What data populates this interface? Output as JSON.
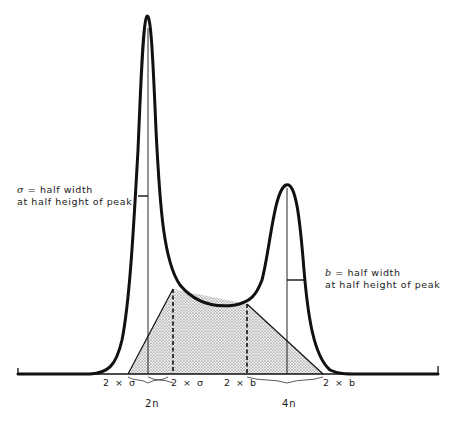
{
  "annotations": {
    "peak1": {
      "symbol": "σ",
      "line1": " = half width",
      "line2": "at half height of peak"
    },
    "peak2": {
      "symbol": "b",
      "line1": " = half width",
      "line2": "at half height of peak"
    }
  },
  "baseline_labels": {
    "left_sigma": "2 × σ",
    "mid_sigma": "2 × σ",
    "mid_b": "2 × b",
    "right_b": "2 × b"
  },
  "positions": {
    "peak1": "2n",
    "peak2": "4n"
  },
  "colors": {
    "ink": "#111111",
    "stipple_fill": "#d9d9d9"
  }
}
